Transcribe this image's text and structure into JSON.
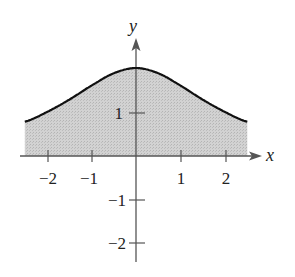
{
  "chart_data": {
    "type": "area",
    "title": "",
    "xlabel": "x",
    "ylabel": "y",
    "function_hint": "bell-shaped curve, peak ≈ 2 at x = 0, ≈ 0.78 at x = ±2.5",
    "x": [
      -2.5,
      -2,
      -1.5,
      -1,
      -0.5,
      0,
      0.5,
      1,
      1.5,
      2,
      2.5
    ],
    "values": [
      0.78,
      1.0,
      1.28,
      1.6,
      1.88,
      2.0,
      1.88,
      1.6,
      1.28,
      1.0,
      0.78
    ],
    "xlim": [
      -2.5,
      2.5
    ],
    "ylim": [
      -2.5,
      2.5
    ],
    "x_ticks": [
      "-2",
      "-1",
      "1",
      "2"
    ],
    "y_ticks": [
      "1",
      "-1",
      "-2"
    ],
    "shaded_region": "area between curve and x-axis from x = -2.5 to x = 2.5",
    "grid": false,
    "colors": {
      "curve": "#111111",
      "fill": "#c8c8c8",
      "axes": "#555555"
    }
  },
  "labels": {
    "x_axis": "x",
    "y_axis": "y",
    "xt": {
      "m2": "−2",
      "m1": "−1",
      "p1": "1",
      "p2": "2"
    },
    "yt": {
      "p1": "1",
      "m1": "−1",
      "m2": "−2"
    }
  }
}
